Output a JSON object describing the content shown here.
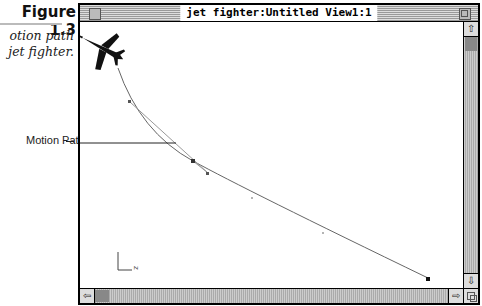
{
  "figure": {
    "label": "Figure 1.3",
    "caption_line1": "otion path",
    "caption_line2": "jet fighter."
  },
  "callout": {
    "label": "Motion Path"
  },
  "window": {
    "title": "jet fighter:Untitled View1:1",
    "icons": {
      "close": "close-box-icon",
      "zoom": "zoom-box-icon",
      "up": "arrow-up-icon",
      "down": "arrow-down-icon",
      "left": "arrow-left-icon",
      "right": "arrow-right-icon",
      "grow": "resize-grow-icon"
    },
    "scroll_glyphs": {
      "up": "⇧",
      "down": "⇩",
      "left": "⇦",
      "right": "⇨"
    }
  },
  "scene": {
    "object": "jet fighter",
    "axes_label": "z",
    "path_color": "#666666",
    "keyframe_color": "#333333"
  }
}
